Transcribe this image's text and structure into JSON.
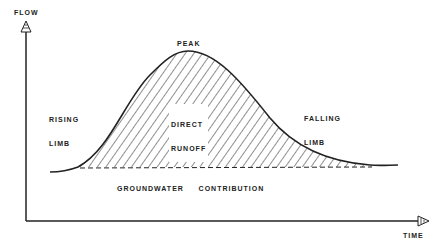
{
  "diagram": {
    "type": "hydrograph",
    "axes": {
      "y_label": "FLOW",
      "x_label": "TIME"
    },
    "labels": {
      "peak": "PEAK",
      "rising_limb_line1": "RISING",
      "rising_limb_line2": "LIMB",
      "direct_runoff_line1": "DIRECT",
      "direct_runoff_line2": "RUNOFF",
      "falling_limb_line1": "FALLING",
      "falling_limb_line2": "LIMB",
      "groundwater": "GROUNDWATER     CONTRIBUTION"
    },
    "colors": {
      "line": "#222222",
      "background": "#ffffff"
    }
  }
}
